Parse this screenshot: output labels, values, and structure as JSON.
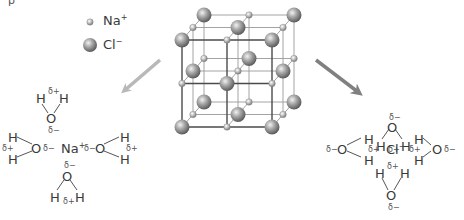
{
  "cropped_caption": "p",
  "legend": {
    "items": [
      {
        "name": "Na",
        "charge": "+",
        "label": "Na⁺",
        "size": "small"
      },
      {
        "name": "Cl",
        "charge": "−",
        "label": "Cl⁻",
        "size": "large"
      }
    ]
  },
  "lattice": {
    "description": "NaCl crystal lattice (3×3×3 alternating ions)",
    "grid": 3
  },
  "arrows": {
    "left": {
      "color": "#b8b8b8",
      "direction": "down-left"
    },
    "right": {
      "color": "#808080",
      "direction": "down-right"
    }
  },
  "hydrated_sodium": {
    "center_ion": "Na",
    "center_charge": "+",
    "waters": [
      {
        "position": "top",
        "O": "O",
        "H1": "H",
        "H2": "H",
        "delta_O": "δ−",
        "delta_H": "δ+"
      },
      {
        "position": "left",
        "O": "O",
        "H1": "H",
        "H2": "H",
        "delta_O": "δ−",
        "delta_H": "δ+"
      },
      {
        "position": "right",
        "O": "O",
        "H1": "H",
        "H2": "H",
        "delta_O": "δ−",
        "delta_H": "δ+"
      },
      {
        "position": "bottom",
        "O": "O",
        "H1": "H",
        "H2": "H",
        "delta_O": "δ−",
        "delta_H": "δ+"
      }
    ]
  },
  "hydrated_chloride": {
    "center_ion": "Cl",
    "center_charge": "−",
    "waters": [
      {
        "position": "top",
        "O": "O",
        "H1": "H",
        "H2": "H",
        "delta_O": "δ−",
        "delta_H": "δ+"
      },
      {
        "position": "left",
        "O": "O",
        "H1": "H",
        "H2": "H",
        "delta_O": "δ−",
        "delta_H": "δ+"
      },
      {
        "position": "right",
        "O": "O",
        "H1": "H",
        "H2": "H",
        "delta_O": "δ−",
        "delta_H": "δ+"
      },
      {
        "position": "bottom",
        "O": "O",
        "H1": "H",
        "H2": "H",
        "delta_O": "δ−",
        "delta_H": "δ+"
      }
    ]
  },
  "symbols": {
    "H": "H",
    "O": "O",
    "Na": "Na",
    "Cl": "Cl",
    "plus": "+",
    "minus": "−",
    "delta_plus": "δ+",
    "delta_minus": "δ−"
  },
  "colors": {
    "text": "#3a3a3a",
    "bond": "#555555",
    "lattice_front": "#4a4a4a",
    "lattice_back": "#9a9a9a",
    "arrow_light": "#b8b8b8",
    "arrow_dark": "#808080"
  }
}
